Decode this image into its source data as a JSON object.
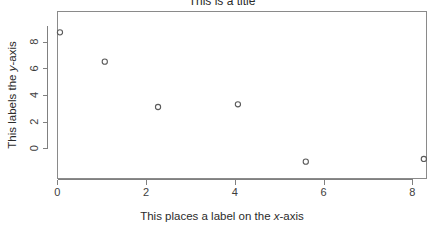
{
  "chart_data": {
    "type": "scatter",
    "title": "This is a title",
    "xlabel": "This places a label on the x-axis",
    "ylabel": "This labels the y-axis",
    "xlabel_parts": {
      "pre": "This places a label on the ",
      "italic": "x",
      "post": "-axis"
    },
    "ylabel_parts": {
      "pre": "This labels the ",
      "italic": "y",
      "post": "-axis"
    },
    "x": [
      0.06,
      1.07,
      2.27,
      4.07,
      5.6,
      8.26
    ],
    "y": [
      8.7,
      6.5,
      3.1,
      3.3,
      -1.0,
      -0.8
    ],
    "points": [
      {
        "x": 0.06,
        "y": 8.7
      },
      {
        "x": 1.07,
        "y": 6.5
      },
      {
        "x": 2.27,
        "y": 3.1
      },
      {
        "x": 4.07,
        "y": 3.3
      },
      {
        "x": 5.6,
        "y": -1.0
      },
      {
        "x": 8.26,
        "y": -0.8
      }
    ],
    "xticks": [
      0,
      2,
      4,
      6,
      8
    ],
    "yticks": [
      0,
      2,
      4,
      6,
      8
    ],
    "xtick_labels": [
      "0",
      "2",
      "4",
      "6",
      "8"
    ],
    "ytick_labels": [
      "0",
      "2",
      "4",
      "6",
      "8"
    ],
    "xlim": [
      -0.38,
      8.72
    ],
    "ylim": [
      -1.55,
      9.25
    ],
    "grid": false,
    "legend": null,
    "marker": "open-circle",
    "marker_color": "#5a5a5a",
    "background": "#ffffff",
    "axis_color": "#808080"
  }
}
